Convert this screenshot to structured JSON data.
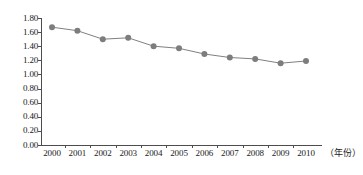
{
  "chart_data": {
    "type": "line",
    "title": "",
    "subtitle": "",
    "xlabel": "（年份）",
    "ylabel": "",
    "categories": [
      "2000",
      "2001",
      "2002",
      "2003",
      "2004",
      "2005",
      "2006",
      "2007",
      "2008",
      "2009",
      "2010"
    ],
    "values": [
      1.67,
      1.62,
      1.5,
      1.52,
      1.4,
      1.37,
      1.29,
      1.24,
      1.22,
      1.16,
      1.19
    ],
    "series": [
      {
        "name": "",
        "values": [
          1.67,
          1.62,
          1.5,
          1.52,
          1.4,
          1.37,
          1.29,
          1.24,
          1.22,
          1.16,
          1.19
        ]
      }
    ],
    "ylim": [
      0.0,
      1.8
    ],
    "ytick_step": 0.2,
    "ytick_labels": [
      "0.00",
      "0.20",
      "0.40",
      "0.60",
      "0.80",
      "1.00",
      "1.20",
      "1.40",
      "1.60",
      "1.80"
    ],
    "ytick_values": [
      0.0,
      0.2,
      0.4,
      0.6,
      0.8,
      1.0,
      1.2,
      1.4,
      1.6,
      1.8
    ],
    "grid": false,
    "legend": "none",
    "marker": "circle",
    "colors": {
      "line": "#808080",
      "marker": "#7d7d7d",
      "axis": "#4d4d4d",
      "text": "#1a1a1a",
      "background": "#ffffff"
    }
  }
}
